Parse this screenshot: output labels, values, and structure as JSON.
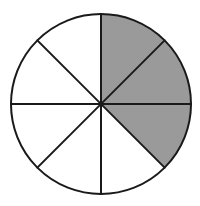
{
  "figure": {
    "kind": "fraction-circle-diagram",
    "background_color": "#ffffff",
    "canvas": {
      "width": 200,
      "height": 206
    }
  },
  "chart_data": {
    "type": "pie",
    "title": "",
    "subtitle": "",
    "xlabel": "",
    "ylabel": "",
    "grid": false,
    "legend": false,
    "legend_position": "none",
    "total_slices": 8,
    "shaded_slices": 3,
    "unshaded_slices": 5,
    "fraction_shaded": "3/8",
    "slice_angle_degrees": 45,
    "categories": [
      "shaded",
      "unshaded"
    ],
    "values": [
      3,
      5
    ],
    "colors": {
      "shaded": "#9a9a9a",
      "unshaded": "#ffffff",
      "outline": "#1a1a1a"
    },
    "geometry": {
      "center_x": 101,
      "center_y": 104,
      "radius": 90,
      "stroke_width": 2
    },
    "slices": [
      {
        "index": 1,
        "start_angle": 0,
        "end_angle": 45,
        "filled": true,
        "fill": "#9a9a9a"
      },
      {
        "index": 2,
        "start_angle": 45,
        "end_angle": 90,
        "filled": true,
        "fill": "#9a9a9a"
      },
      {
        "index": 3,
        "start_angle": 90,
        "end_angle": 135,
        "filled": false,
        "fill": "#ffffff"
      },
      {
        "index": 4,
        "start_angle": 135,
        "end_angle": 180,
        "filled": false,
        "fill": "#ffffff"
      },
      {
        "index": 5,
        "start_angle": 180,
        "end_angle": 225,
        "filled": false,
        "fill": "#ffffff"
      },
      {
        "index": 6,
        "start_angle": 225,
        "end_angle": 270,
        "filled": false,
        "fill": "#ffffff"
      },
      {
        "index": 7,
        "start_angle": 270,
        "end_angle": 315,
        "filled": false,
        "fill": "#ffffff"
      },
      {
        "index": 8,
        "start_angle": 315,
        "end_angle": 360,
        "filled": true,
        "fill": "#9a9a9a"
      }
    ],
    "dividers": [
      {
        "name": "vertical-diameter",
        "angle_degrees": 90
      },
      {
        "name": "horizontal-diameter",
        "angle_degrees": 0
      },
      {
        "name": "diagonal-diameter-45",
        "angle_degrees": 45
      },
      {
        "name": "diagonal-diameter-135",
        "angle_degrees": 135
      }
    ]
  }
}
